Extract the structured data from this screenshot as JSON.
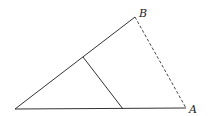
{
  "diagram": {
    "title": "",
    "colors": {
      "background": "#ffffff",
      "stroke": "#333333",
      "label": "#222222"
    },
    "points": {
      "O": {
        "x": 15,
        "y": 109,
        "label": ""
      },
      "B": {
        "x": 135,
        "y": 17,
        "label": "B"
      },
      "A": {
        "x": 186,
        "y": 108,
        "label": "A"
      },
      "P": {
        "x": 83,
        "y": 57,
        "label": ""
      },
      "Q": {
        "x": 123,
        "y": 109,
        "label": ""
      }
    },
    "segments": [
      {
        "from": "O",
        "to": "B",
        "style": "solid"
      },
      {
        "from": "O",
        "to": "A",
        "style": "solid"
      },
      {
        "from": "B",
        "to": "A",
        "style": "dashed"
      },
      {
        "from": "P",
        "to": "Q",
        "style": "solid"
      }
    ],
    "labels": {
      "B": {
        "text": "B",
        "x": 139,
        "y": 17
      },
      "A": {
        "text": "A",
        "x": 189,
        "y": 113
      }
    }
  }
}
